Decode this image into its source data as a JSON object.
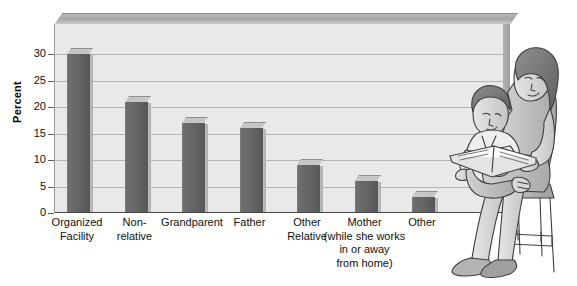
{
  "chart_data": {
    "type": "bar",
    "title": "",
    "xlabel": "",
    "ylabel": "Percent",
    "ylim": [
      0,
      30
    ],
    "yticks": [
      0,
      5,
      10,
      15,
      20,
      25,
      30
    ],
    "grid": true,
    "legend": "none",
    "categories": [
      "Organized\nFacility",
      "Non-\nrelative",
      "Grandparent",
      "Father",
      "Other\nRelative",
      "Mother\n(while she works\nin or away\nfrom home)",
      "Other"
    ],
    "values": [
      30,
      21,
      17,
      16,
      9,
      6,
      3
    ],
    "series": [
      {
        "name": "Percent",
        "values": [
          30,
          21,
          17,
          16,
          9,
          6,
          3
        ]
      }
    ],
    "colors": {
      "bar_front": "#636363",
      "bar_top": "#c6c6c6",
      "bar_side": "#b0b0b0",
      "plot_background": "#e9e9e9",
      "gridline": "#b4b4b4",
      "axis": "#4a4a4a",
      "text": "#101010"
    }
  },
  "illustration": {
    "name": "woman-reading-to-child-on-stool",
    "description": "Grayscale line illustration of a woman seated on a wooden stool reading a book to a young child on her lap"
  }
}
